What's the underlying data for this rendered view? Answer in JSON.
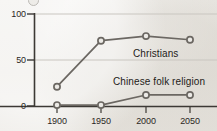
{
  "chart_data": {
    "type": "line",
    "title": "",
    "subtitle": "",
    "xlabel": "",
    "ylabel": "",
    "x": [
      1900,
      1950,
      2000,
      2050
    ],
    "x_tick_labels": [
      "1900",
      "1950",
      "2000",
      "2050"
    ],
    "y_tick_labels": [
      "0",
      "50",
      "100"
    ],
    "y_ticks": [
      0,
      50,
      100
    ],
    "ylim": [
      0,
      100
    ],
    "xlim": [
      1885,
      2062
    ],
    "grid": true,
    "grid_axis": "y",
    "legend": "inline-labels",
    "legend_position": "inside-right",
    "marker": "open-circle",
    "series": [
      {
        "name": "Christians",
        "label": "Christians",
        "values": [
          21,
          71,
          76,
          72
        ],
        "color": "#6b6762",
        "label_x": 133,
        "label_y": 48
      },
      {
        "name": "Chinese folk religion",
        "label": "Chinese folk religion",
        "values": [
          1,
          1,
          12,
          12
        ],
        "color": "#6b6762",
        "label_x": 113,
        "label_y": 76
      }
    ]
  },
  "axes": {
    "y_labels": [
      {
        "text": "100",
        "top": 9,
        "left": 2
      },
      {
        "text": "50",
        "top": 55,
        "left": 2
      },
      {
        "text": "0",
        "top": 101,
        "left": 2
      }
    ],
    "x_labels": [
      {
        "text": "1900",
        "left": 40,
        "top": 116
      },
      {
        "text": "1950",
        "left": 84,
        "top": 116
      },
      {
        "text": "2000",
        "left": 129,
        "top": 116
      },
      {
        "text": "2050",
        "left": 173,
        "top": 116
      }
    ]
  },
  "colors": {
    "background": "#eceae6",
    "axis": "#3c3935",
    "gridline": "#c9c6c0",
    "line": "#6b6762",
    "marker_fill": "#eceae6",
    "text": "#2a2724"
  },
  "icons": {
    "clipped_marker": "open-circle-icon"
  }
}
